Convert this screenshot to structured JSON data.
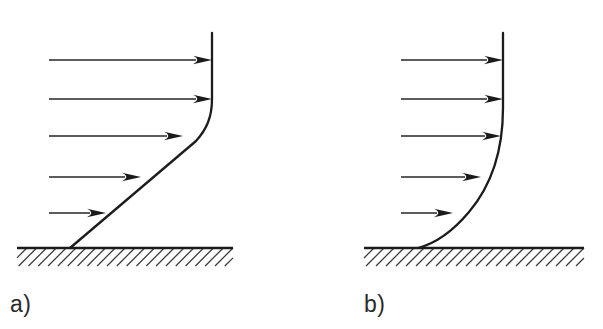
{
  "figure": {
    "background_color": "#ffffff",
    "line_color": "#1c1c1c",
    "hatch_color": "#3a3a3a",
    "arrow_color": "#262626"
  },
  "panels": [
    {
      "id": "panel-a",
      "caption": "a)",
      "caption_x": 10,
      "caption_y": 312,
      "profile_type": "turbulent-like-kinked",
      "ground": {
        "x1": 17,
        "x2": 233,
        "y": 248,
        "hatch_count": 22,
        "hatch_height": 18
      },
      "wall_x": 212,
      "wall_top_y": 33,
      "curve_path": "M 212 33 L 212 99 C 212 118 206 130 196 141 L 70 248",
      "arrows": [
        {
          "x_start": 49,
          "x_end": 212,
          "y": 60
        },
        {
          "x_start": 49,
          "x_end": 212,
          "y": 99
        },
        {
          "x_start": 49,
          "x_end": 183,
          "y": 136
        },
        {
          "x_start": 49,
          "x_end": 141,
          "y": 177
        },
        {
          "x_start": 49,
          "x_end": 106,
          "y": 213
        }
      ]
    },
    {
      "id": "panel-b",
      "caption": "b)",
      "caption_x": 63,
      "caption_y": 312,
      "profile_type": "laminar-parabolic",
      "ground": {
        "x1": 63,
        "x2": 283,
        "y": 248,
        "hatch_count": 22,
        "hatch_height": 18
      },
      "wall_x": 202,
      "wall_top_y": 33,
      "curve_path": "M 202 33 L 202 108 C 202 150 190 186 168 212 C 152 231 136 243 117 248",
      "arrows": [
        {
          "x_start": 100,
          "x_end": 202,
          "y": 60
        },
        {
          "x_start": 100,
          "x_end": 202,
          "y": 99
        },
        {
          "x_start": 100,
          "x_end": 200,
          "y": 136
        },
        {
          "x_start": 100,
          "x_end": 180,
          "y": 177
        },
        {
          "x_start": 100,
          "x_end": 152,
          "y": 213
        }
      ]
    }
  ],
  "arrowhead": {
    "length": 19,
    "half_height": 4.2
  }
}
